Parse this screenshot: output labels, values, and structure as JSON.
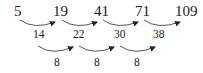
{
  "diagram": {
    "type": "difference-sequence",
    "sequence": [
      "5",
      "19",
      "41",
      "71",
      "109"
    ],
    "first_differences": [
      "14",
      "22",
      "30",
      "38"
    ],
    "second_differences": [
      "8",
      "8",
      "8"
    ]
  }
}
